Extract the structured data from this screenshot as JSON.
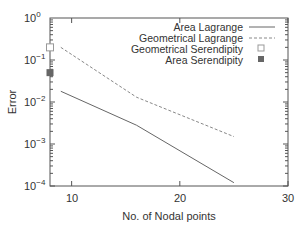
{
  "chart_data": {
    "type": "line",
    "title": "",
    "xlabel": "No. of Nodal points",
    "ylabel": "Error",
    "xlim": [
      8,
      30
    ],
    "ylim": [
      0.0001,
      1
    ],
    "yscale": "log",
    "xticks": [
      10,
      20,
      30
    ],
    "yticks": [
      "10^0",
      "10^-1",
      "10^-2",
      "10^-3",
      "10^-4"
    ],
    "grid": false,
    "legend_position": "upper right",
    "series": [
      {
        "name": "Area Lagrange",
        "style": "solid",
        "x": [
          9,
          16,
          25
        ],
        "y": [
          0.018,
          0.0028,
          0.00012
        ]
      },
      {
        "name": "Geometrical Lagrange",
        "style": "dashed",
        "x": [
          9,
          16,
          25
        ],
        "y": [
          0.2,
          0.013,
          0.0015
        ]
      },
      {
        "name": "Geometrical Serendipity",
        "style": "open-square",
        "x": [
          8
        ],
        "y": [
          0.2
        ]
      },
      {
        "name": "Area Serendipity",
        "style": "filled-square",
        "x": [
          8
        ],
        "y": [
          0.05
        ]
      }
    ]
  },
  "labels": {
    "xlabel": "No. of Nodal points",
    "ylabel": "Error",
    "xticks": [
      "10",
      "20",
      "30"
    ],
    "ytick_base": "10",
    "ytick_exp": [
      "0",
      "−1",
      "−2",
      "−3",
      "−4"
    ],
    "legend": [
      "Area Lagrange",
      "Geometrical Lagrange",
      "Geometrical Serendipity",
      "Area Serendipity"
    ]
  }
}
